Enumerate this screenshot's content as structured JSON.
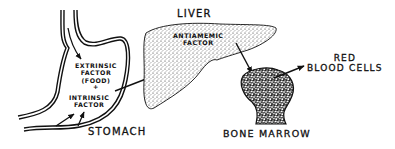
{
  "diagram": {
    "type": "anatomical-process-flow",
    "organs": {
      "stomach": {
        "label": "STOMACH"
      },
      "liver": {
        "label": "LIVER"
      },
      "bone_marrow": {
        "label": "BONE MARROW"
      }
    },
    "stomach_contents": {
      "line1": "EXTRINSIC",
      "line2": "FACTOR",
      "line3": "(FOOD)",
      "plus": "+",
      "line4": "INTRINSIC",
      "line5": "FACTOR"
    },
    "liver_contents": {
      "line1": "ANTIAMEMIC",
      "line2": "FACTOR"
    },
    "output": {
      "line1": "RED",
      "line2": "BLOOD CELLS"
    },
    "flow": [
      {
        "from": "food (esophagus)",
        "to": "stomach"
      },
      {
        "from": "stomach wall",
        "to": "intrinsic factor"
      },
      {
        "from": "stomach",
        "to": "liver"
      },
      {
        "from": "liver",
        "to": "bone marrow"
      },
      {
        "from": "bone marrow",
        "to": "red blood cells"
      }
    ],
    "colors": {
      "ink": "#111111",
      "background": "#ffffff"
    }
  }
}
